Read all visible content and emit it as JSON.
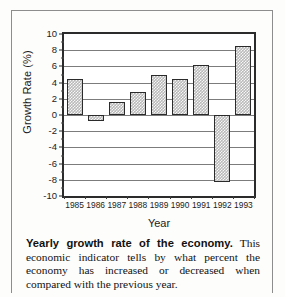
{
  "figure": {
    "y_axis_title": "Growth Rate (%)",
    "x_axis_title": "Year"
  },
  "caption": {
    "lead": "Yearly growth rate of the economy.",
    "body": " This economic indicator tells by what percent the economy has increased or decreased when compared with the previous year."
  },
  "chart_data": {
    "type": "bar",
    "title": "",
    "xlabel": "Year",
    "ylabel": "Growth Rate (%)",
    "categories": [
      "1985",
      "1986",
      "1987",
      "1988",
      "1989",
      "1990",
      "1991",
      "1992",
      "1993"
    ],
    "values": [
      4.5,
      -0.7,
      1.6,
      2.8,
      5.0,
      4.4,
      6.2,
      -8.3,
      8.5
    ],
    "ylim": [
      -10,
      10
    ],
    "ytick_labels": [
      "10",
      "8",
      "6",
      "4",
      "2",
      "0",
      "-2",
      "-4",
      "-6",
      "-8",
      "-10"
    ],
    "ytick_values": [
      10,
      8,
      6,
      4,
      2,
      0,
      -2,
      -4,
      -6,
      -8,
      -10
    ],
    "yminor_step": 1,
    "grid": true,
    "legend": "none",
    "bar_fill": "#b9b9b9",
    "bar_edge": "#2b2b2b",
    "axis_color": "#2b2b2b"
  }
}
